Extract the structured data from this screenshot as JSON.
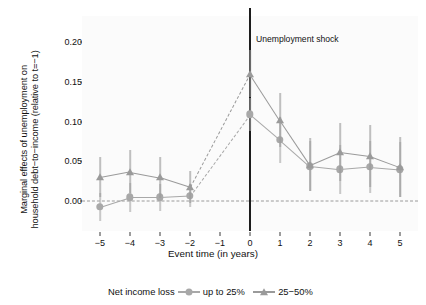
{
  "chart_data": {
    "type": "line",
    "title": "",
    "xlabel": "Event time (in years)",
    "ylabel_line1": "Marginal effects of unemployment on",
    "ylabel_line2": "household debt−to−income (relative to t=−1)",
    "x": [
      -5,
      -4,
      -3,
      -2,
      0,
      1,
      2,
      3,
      4,
      5
    ],
    "xticklabels": [
      "−5",
      "−4",
      "−3",
      "−2",
      "−1",
      "0",
      "1",
      "2",
      "3",
      "4",
      "5"
    ],
    "xtickvalues": [
      -5,
      -4,
      -3,
      -2,
      -1,
      0,
      1,
      2,
      3,
      4,
      5
    ],
    "yticklabels": [
      "0.00",
      "0.05",
      "0.10",
      "0.15",
      "0.20"
    ],
    "ytickvalues": [
      0.0,
      0.05,
      0.1,
      0.15,
      0.2
    ],
    "xlim": [
      -5.6,
      5.6
    ],
    "ylim": [
      -0.037,
      0.232
    ],
    "grid": false,
    "legend_position": "bottom",
    "legend_title": "Net income loss",
    "reference_line_y": 0.0,
    "reference_period": -1,
    "annotation": "Unemployment shock",
    "annotation_x": 0,
    "series": [
      {
        "name": "up to 25%",
        "marker": "circle",
        "color": "#a8a8a8",
        "values": [
          -0.007,
          0.005,
          0.005,
          0.007,
          0.109,
          0.077,
          0.044,
          0.04,
          0.043,
          0.04
        ],
        "ci_low": [
          -0.024,
          -0.013,
          -0.012,
          -0.007,
          0.088,
          0.048,
          0.013,
          0.009,
          0.01,
          0.006
        ],
        "ci_high": [
          0.01,
          0.023,
          0.022,
          0.022,
          0.13,
          0.106,
          0.075,
          0.071,
          0.076,
          0.074
        ]
      },
      {
        "name": "25−50%",
        "marker": "triangle",
        "color": "#9a9a9a",
        "values": [
          0.03,
          0.037,
          0.03,
          0.018,
          0.16,
          0.102,
          0.046,
          0.062,
          0.057,
          0.043
        ],
        "ci_low": [
          0.005,
          0.01,
          0.004,
          -0.002,
          0.131,
          0.068,
          0.013,
          0.026,
          0.018,
          0.005
        ],
        "ci_high": [
          0.055,
          0.064,
          0.055,
          0.038,
          0.189,
          0.136,
          0.079,
          0.098,
          0.096,
          0.081
        ]
      }
    ]
  },
  "legend": {
    "title": "Net income loss",
    "entries": [
      {
        "label": "up to 25%",
        "marker": "circle-marker",
        "color": "#a8a8a8"
      },
      {
        "label": "25−50%",
        "marker": "triangle-marker",
        "color": "#9a9a9a"
      }
    ]
  },
  "colors": {
    "series_circle": "#a8a8a8",
    "series_triangle": "#9a9a9a",
    "zero_line": "#9a9a9a",
    "shock_line": "#1c1c1c",
    "panel_background": "#fbfbfb",
    "text": "#111111"
  }
}
